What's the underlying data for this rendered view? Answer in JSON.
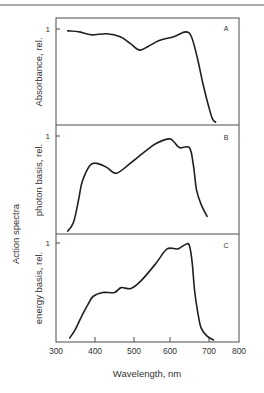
{
  "figure": {
    "shared_ylabel": "Action spectra",
    "xlabel": "Wavelength, nm",
    "x_ticks": [
      300,
      400,
      500,
      600,
      700,
      800
    ],
    "x_tick_px": [
      56,
      95,
      134,
      170,
      209,
      239
    ],
    "line_color": "#1f1f1f",
    "axis_color": "#4a4a4a"
  },
  "chart_data": [
    {
      "type": "line",
      "panel": "A",
      "title": "",
      "xlabel": "Wavelength, nm",
      "ylabel": "Absorbance, rel.",
      "y_tick_labels": [
        "1"
      ],
      "xlim": [
        300,
        800
      ],
      "ylim": [
        0,
        1
      ],
      "grid": false,
      "x": [
        330,
        360,
        390,
        430,
        465,
        490,
        515,
        540,
        570,
        610,
        640,
        655,
        670,
        685,
        700,
        712,
        722
      ],
      "values": [
        0.98,
        0.97,
        0.94,
        0.95,
        0.92,
        0.85,
        0.78,
        0.82,
        0.88,
        0.92,
        0.97,
        0.92,
        0.7,
        0.42,
        0.18,
        0.06,
        0.03
      ]
    },
    {
      "type": "line",
      "panel": "B",
      "title": "",
      "xlabel": "Wavelength, nm",
      "ylabel": "photon basis, rel.",
      "y_tick_labels": [
        "1"
      ],
      "xlim": [
        300,
        800
      ],
      "ylim": [
        0,
        1
      ],
      "grid": false,
      "x": [
        330,
        345,
        358,
        367,
        387,
        405,
        430,
        455,
        490,
        530,
        560,
        597,
        610,
        625,
        650,
        660,
        668,
        680,
        695
      ],
      "values": [
        0.03,
        0.12,
        0.35,
        0.53,
        0.7,
        0.72,
        0.68,
        0.62,
        0.72,
        0.84,
        0.92,
        0.97,
        0.94,
        0.88,
        0.88,
        0.7,
        0.45,
        0.3,
        0.18
      ]
    },
    {
      "type": "line",
      "panel": "C",
      "title": "",
      "xlabel": "Wavelength, nm",
      "ylabel": "energy basis, rel.",
      "y_tick_labels": [
        "1"
      ],
      "xlim": [
        300,
        800
      ],
      "ylim": [
        0,
        1
      ],
      "grid": false,
      "x": [
        335,
        350,
        367,
        382,
        395,
        420,
        450,
        467,
        492,
        520,
        560,
        592,
        620,
        642,
        650,
        657,
        663,
        672,
        680,
        695,
        715
      ],
      "values": [
        0.04,
        0.13,
        0.27,
        0.38,
        0.46,
        0.5,
        0.5,
        0.55,
        0.54,
        0.62,
        0.79,
        0.94,
        0.94,
        0.99,
        0.97,
        0.8,
        0.52,
        0.28,
        0.14,
        0.06,
        0.02
      ]
    }
  ]
}
